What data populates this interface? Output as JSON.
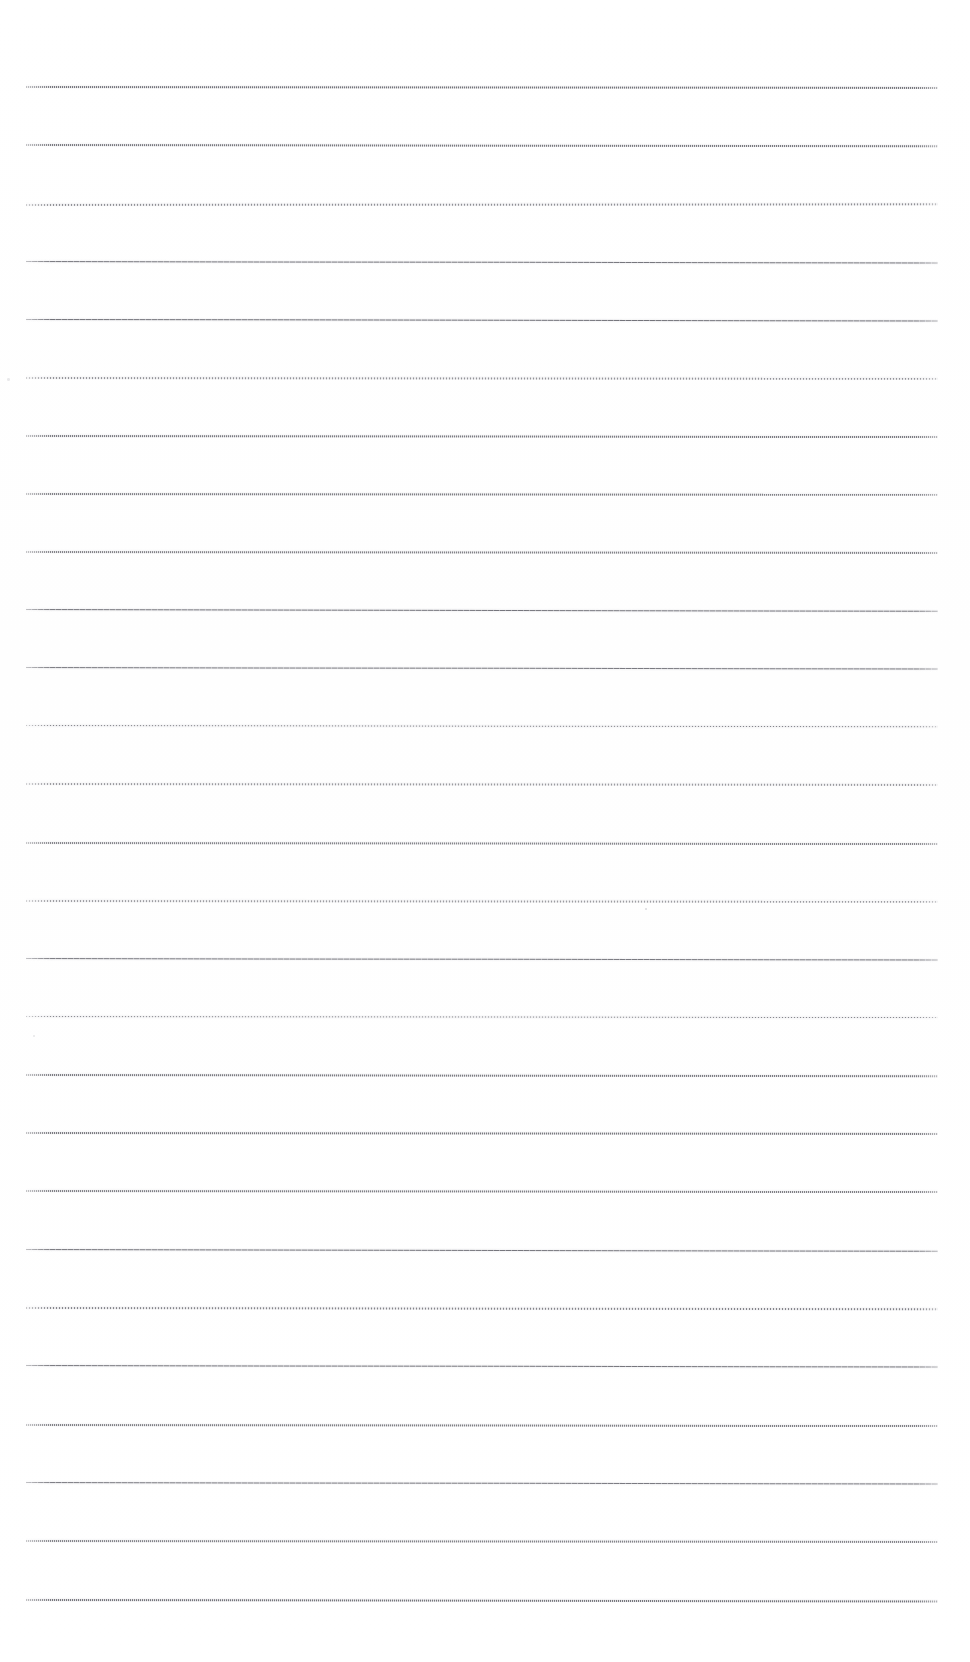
{
  "document": {
    "kind": "scanned-blank-ruled-page",
    "title": "Blank Ruled Notebook Page",
    "page_width": 970,
    "page_height": 1662,
    "background_color": "#ffffff",
    "ink_color": "#4a4a52",
    "visible_text": "",
    "notes": "No text, headings, numbers, or graphics are present — the page is an empty scanned sheet of horizontal ruled lines."
  },
  "ruling": {
    "line_count": 27,
    "line_left_x": 26,
    "line_right_x": 938,
    "line_length": 912,
    "first_line_y": 87,
    "average_spacing": 58.2,
    "top_margin": 87,
    "bottom_margin": 62,
    "left_margin": 26,
    "right_margin": 32,
    "orientation": "horizontal",
    "stroke_color_dark": "#46464e",
    "stroke_color_light": "#a8a8b0"
  },
  "lines": [
    {
      "index": 1,
      "y": 87,
      "thickness": 1.6,
      "opacity": 0.8,
      "texture": "tex-dotted",
      "slope_deg": 0.06
    },
    {
      "index": 2,
      "y": 145,
      "thickness": 1.7,
      "opacity": 0.78,
      "texture": "tex-dotted",
      "slope_deg": 0.08
    },
    {
      "index": 3,
      "y": 205,
      "thickness": 1.5,
      "opacity": 0.72,
      "texture": "tex-fine",
      "slope_deg": -0.04
    },
    {
      "index": 4,
      "y": 262,
      "thickness": 1.3,
      "opacity": 0.88,
      "texture": "tex-solid",
      "slope_deg": 0.1
    },
    {
      "index": 5,
      "y": 320,
      "thickness": 1.3,
      "opacity": 0.9,
      "texture": "tex-solid",
      "slope_deg": 0.09
    },
    {
      "index": 6,
      "y": 378,
      "thickness": 1.6,
      "opacity": 0.7,
      "texture": "tex-fine",
      "slope_deg": 0.05
    },
    {
      "index": 7,
      "y": 436,
      "thickness": 1.8,
      "opacity": 0.76,
      "texture": "tex-dotted",
      "slope_deg": 0.07
    },
    {
      "index": 8,
      "y": 494,
      "thickness": 1.7,
      "opacity": 0.74,
      "texture": "tex-dotted",
      "slope_deg": 0.05
    },
    {
      "index": 9,
      "y": 552,
      "thickness": 1.7,
      "opacity": 0.72,
      "texture": "tex-dotted",
      "slope_deg": 0.06
    },
    {
      "index": 10,
      "y": 610,
      "thickness": 1.3,
      "opacity": 0.88,
      "texture": "tex-solid",
      "slope_deg": 0.11
    },
    {
      "index": 11,
      "y": 668,
      "thickness": 1.3,
      "opacity": 0.86,
      "texture": "tex-solid",
      "slope_deg": 0.1
    },
    {
      "index": 12,
      "y": 726,
      "thickness": 1.4,
      "opacity": 0.8,
      "texture": "tex-fine",
      "slope_deg": 0.08
    },
    {
      "index": 13,
      "y": 784,
      "thickness": 1.6,
      "opacity": 0.66,
      "texture": "tex-fine",
      "slope_deg": 0.06
    },
    {
      "index": 14,
      "y": 843,
      "thickness": 1.7,
      "opacity": 0.7,
      "texture": "tex-dotted",
      "slope_deg": 0.07
    },
    {
      "index": 15,
      "y": 901,
      "thickness": 1.6,
      "opacity": 0.64,
      "texture": "tex-fine",
      "slope_deg": 0.05
    },
    {
      "index": 16,
      "y": 959,
      "thickness": 1.3,
      "opacity": 0.86,
      "texture": "tex-solid",
      "slope_deg": 0.1
    },
    {
      "index": 17,
      "y": 1017,
      "thickness": 1.4,
      "opacity": 0.78,
      "texture": "tex-fine",
      "slope_deg": 0.07
    },
    {
      "index": 18,
      "y": 1075,
      "thickness": 1.8,
      "opacity": 0.76,
      "texture": "tex-dotted",
      "slope_deg": 0.08
    },
    {
      "index": 19,
      "y": 1133,
      "thickness": 1.8,
      "opacity": 0.78,
      "texture": "tex-dotted",
      "slope_deg": 0.06
    },
    {
      "index": 20,
      "y": 1191,
      "thickness": 1.7,
      "opacity": 0.74,
      "texture": "tex-dotted",
      "slope_deg": 0.07
    },
    {
      "index": 21,
      "y": 1250,
      "thickness": 1.3,
      "opacity": 0.88,
      "texture": "tex-solid",
      "slope_deg": 0.11
    },
    {
      "index": 22,
      "y": 1308,
      "thickness": 1.5,
      "opacity": 0.8,
      "texture": "tex-fine",
      "slope_deg": 0.08
    },
    {
      "index": 23,
      "y": 1366,
      "thickness": 1.3,
      "opacity": 0.88,
      "texture": "tex-solid",
      "slope_deg": 0.1
    },
    {
      "index": 24,
      "y": 1425,
      "thickness": 1.7,
      "opacity": 0.74,
      "texture": "tex-dotted",
      "slope_deg": 0.07
    },
    {
      "index": 25,
      "y": 1483,
      "thickness": 1.3,
      "opacity": 0.86,
      "texture": "tex-solid",
      "slope_deg": 0.1
    },
    {
      "index": 26,
      "y": 1541,
      "thickness": 1.7,
      "opacity": 0.72,
      "texture": "tex-dotted",
      "slope_deg": 0.06
    },
    {
      "index": 27,
      "y": 1600,
      "thickness": 1.8,
      "opacity": 0.8,
      "texture": "tex-dotted",
      "slope_deg": 0.09
    }
  ],
  "artifacts": [
    {
      "name": "scan-speck",
      "x": 645,
      "y": 908,
      "size": 2.0,
      "opacity": 0.5
    },
    {
      "name": "scan-speck",
      "x": 7,
      "y": 378,
      "size": 2.5,
      "opacity": 0.28
    },
    {
      "name": "scan-speck",
      "x": 33,
      "y": 1035,
      "size": 1.6,
      "opacity": 0.3
    }
  ]
}
